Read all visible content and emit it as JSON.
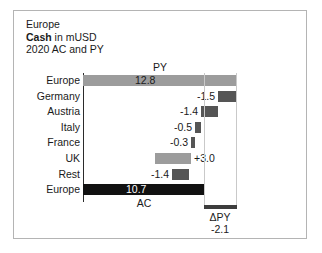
{
  "header": {
    "line1": "Europe",
    "line2_bold": "Cash",
    "line2_rest": " in mUSD",
    "line3": "2020 AC and PY"
  },
  "labels": {
    "py_caption": "PY",
    "ac_caption": "AC",
    "delta_caption": "ΔPY",
    "delta_value": "-2.1"
  },
  "colors": {
    "py_bar": "#9c9c9c",
    "uk_bar": "#9c9c9c",
    "negative_bar": "#555555",
    "ac_bar": "#111111",
    "delta_bar": "#3d3d3d",
    "axis": "#2b2b2b",
    "frame": "#b4b4b4",
    "text": "#1a1a1a"
  },
  "chart_data": {
    "type": "bar",
    "subtype": "waterfall",
    "xlabel": "",
    "ylabel": "",
    "unit": "mUSD",
    "categories": [
      "Europe",
      "Germany",
      "Austria",
      "Italy",
      "France",
      "UK",
      "Rest",
      "Europe"
    ],
    "value_labels": [
      "12.8",
      "-1.5",
      "-1.4",
      "-0.5",
      "-0.3",
      "+3.0",
      "-1.4",
      "10.7"
    ],
    "values": [
      12.8,
      -1.5,
      -1.4,
      -0.5,
      -0.3,
      3.0,
      -1.4,
      10.7
    ],
    "bar_types": [
      "total",
      "delta",
      "delta",
      "delta",
      "delta",
      "delta",
      "delta",
      "total"
    ],
    "start_total_label": "PY",
    "end_total_label": "AC",
    "delta_total": {
      "label": "ΔPY",
      "value": -2.1,
      "value_label": "-2.1"
    },
    "grid": false,
    "legend": false,
    "xlim": [
      0,
      12.8
    ]
  },
  "rows": [
    {
      "name": "Europe",
      "value_label": "12.8",
      "bar": {
        "left": 69,
        "width": 153,
        "color_key": "py_bar",
        "kind": "total"
      },
      "label": {
        "text": "12.8",
        "left": 121,
        "placement": "inside"
      }
    },
    {
      "name": "Germany",
      "value_label": "-1.5",
      "bar": {
        "left": 204,
        "width": 18,
        "color_key": "negative_bar",
        "kind": "negative"
      },
      "label": {
        "text": "-1.5",
        "left": 183,
        "placement": "left"
      }
    },
    {
      "name": "Austria",
      "value_label": "-1.4",
      "bar": {
        "left": 187,
        "width": 17,
        "color_key": "negative_bar",
        "kind": "negative"
      },
      "label": {
        "text": "-1.4",
        "left": 166,
        "placement": "left"
      }
    },
    {
      "name": "Italy",
      "value_label": "-0.5",
      "bar": {
        "left": 181,
        "width": 6,
        "color_key": "negative_bar",
        "kind": "negative"
      },
      "label": {
        "text": "-0.5",
        "left": 160,
        "placement": "left"
      }
    },
    {
      "name": "France",
      "value_label": "-0.3",
      "bar": {
        "left": 177,
        "width": 4,
        "color_key": "negative_bar",
        "kind": "negative"
      },
      "label": {
        "text": "-0.3",
        "left": 156,
        "placement": "left"
      }
    },
    {
      "name": "UK",
      "value_label": "+3.0",
      "bar": {
        "left": 141,
        "width": 36,
        "color_key": "uk_bar",
        "kind": "positive"
      },
      "label": {
        "text": "+3.0",
        "left": 180,
        "placement": "right"
      }
    },
    {
      "name": "Rest",
      "value_label": "-1.4",
      "bar": {
        "left": 158,
        "width": 17,
        "color_key": "negative_bar",
        "kind": "negative"
      },
      "label": {
        "text": "-1.4",
        "left": 137,
        "placement": "left"
      }
    },
    {
      "name": "Europe",
      "value_label": "10.7",
      "bar": {
        "left": 69,
        "width": 121,
        "color_key": "ac_bar",
        "kind": "total"
      },
      "label": {
        "text": "10.7",
        "left": 112,
        "placement": "inside-dark"
      }
    }
  ]
}
